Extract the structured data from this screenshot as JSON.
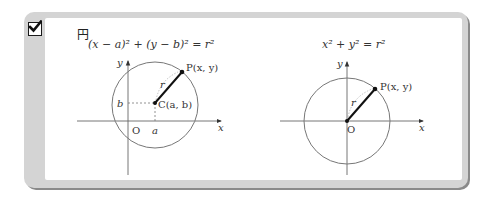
{
  "card": {
    "title": "円",
    "checked": true
  },
  "diagrams": [
    {
      "formula": "(x − a)² + (y − b)² = r²",
      "x_axis_label": "x",
      "y_axis_label": "y",
      "origin_label": "O",
      "center_label": "C(a, b)",
      "point_label": "P(x, y)",
      "radius_label": "r",
      "a_label": "a",
      "b_label": "b"
    },
    {
      "formula": "x² + y² = r²",
      "x_axis_label": "x",
      "y_axis_label": "y",
      "origin_label": "O",
      "point_label": "P(x, y)",
      "radius_label": "r"
    }
  ],
  "colors": {
    "frame": "#d4d4d4",
    "frame_shadow": "#8a8a8a",
    "circle": "#777777",
    "axis": "#666666",
    "ink": "#111111"
  }
}
